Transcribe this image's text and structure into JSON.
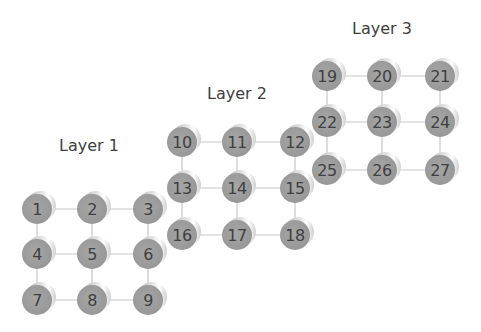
{
  "colors": {
    "background": "#ffffff",
    "node_face": "#9a9a9a",
    "node_rim": "#e0e0e0",
    "edge": "#c8c8c8",
    "text": "#404040"
  },
  "node_diameter": 30,
  "layers": [
    {
      "label": "Layer 1",
      "label_pos": [
        59,
        136
      ],
      "cols": [
        37,
        92,
        148
      ],
      "rows": [
        209,
        254,
        300
      ],
      "nodes": [
        "1",
        "2",
        "3",
        "4",
        "5",
        "6",
        "7",
        "8",
        "9"
      ]
    },
    {
      "label": "Layer 2",
      "label_pos": [
        207,
        84
      ],
      "cols": [
        182,
        237,
        295
      ],
      "rows": [
        142,
        188,
        235
      ],
      "nodes": [
        "10",
        "11",
        "12",
        "13",
        "14",
        "15",
        "16",
        "17",
        "18"
      ]
    },
    {
      "label": "Layer 3",
      "label_pos": [
        352,
        19
      ],
      "cols": [
        327,
        382,
        440
      ],
      "rows": [
        76,
        122,
        170
      ],
      "nodes": [
        "19",
        "20",
        "21",
        "22",
        "23",
        "24",
        "25",
        "26",
        "27"
      ]
    }
  ]
}
